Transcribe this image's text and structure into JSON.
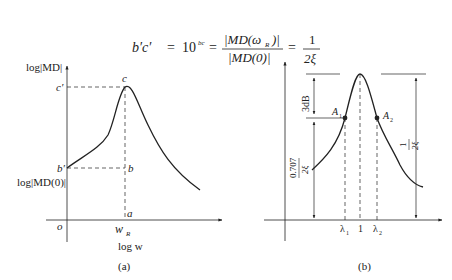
{
  "equation": {
    "lhs": "b′c′",
    "eq1": "=",
    "power_base": "10",
    "power_exp": "bc",
    "eq2": "=",
    "num": "|MD(ω",
    "num_sub": "R",
    "num_end": ")|",
    "den": "|MD(0)|",
    "eq3": "=",
    "frac_num": "1",
    "frac_den": "2ξ"
  },
  "panel_a": {
    "y_axis_label": "log|MD|",
    "x_axis_label": "log w",
    "caption": "(a)",
    "labels": {
      "c": "c",
      "c_prime": "c′",
      "b": "b",
      "b_prime": "b′",
      "a": "a",
      "o": "o",
      "wR": "w",
      "wR_sub": "R",
      "log_md0": "log|MD(0)|"
    }
  },
  "panel_b": {
    "caption": "(b)",
    "labels": {
      "db3": "3dB",
      "A1": "A",
      "A1_sub": "1",
      "A2": "A",
      "A2_sub": "2",
      "left_frac_num": "0.707",
      "left_frac_den": "2ξ",
      "right_frac_num": "1",
      "right_frac_den": "2ξ",
      "lambda1": "λ",
      "lambda1_sub": "1",
      "one": "1",
      "lambda2": "λ",
      "lambda2_sub": "2"
    }
  }
}
